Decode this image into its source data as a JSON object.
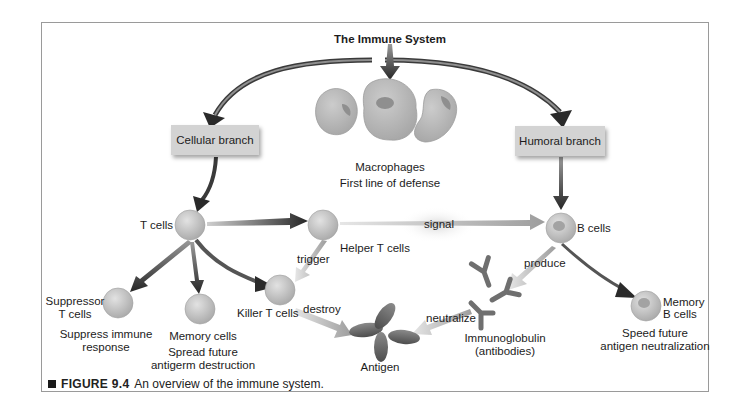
{
  "diagram": {
    "title": "The Immune System",
    "branches": {
      "cellular": "Cellular branch",
      "humoral": "Humoral branch"
    },
    "macrophages": {
      "name": "Macrophages",
      "role": "First line of defense"
    },
    "cells": {
      "t_cells": "T cells",
      "helper_t": "Helper T cells",
      "b_cells": "B cells",
      "suppressor_t_line1": "Suppressor",
      "suppressor_t_line2": "T cells",
      "suppressor_role_line1": "Suppress immune",
      "suppressor_role_line2": "response",
      "memory_cells": "Memory cells",
      "memory_role_line1": "Spread future",
      "memory_role_line2": "antigerm destruction",
      "killer_t": "Killer T cells",
      "memory_b_line1": "Memory",
      "memory_b_line2": "B cells",
      "memory_b_role_line1": "Speed future",
      "memory_b_role_line2": "antigen neutralization",
      "antigen": "Antigen",
      "immunoglobulin_line1": "Immunoglobulin",
      "immunoglobulin_line2": "(antibodies)"
    },
    "edges": {
      "signal": "signal",
      "trigger": "trigger",
      "destroy": "destroy",
      "produce": "produce",
      "neutralize": "neutralize"
    },
    "colors": {
      "box_fill": "#d3d3d3",
      "cell_fill": "#c9c9c9",
      "macrophage_fill": "#bdbdbd",
      "arrow_dark": "#2a2a2a",
      "arrow_light": "#b5b5b5",
      "frame_border": "#9a9a9a"
    }
  },
  "caption": {
    "figure_label": "FIGURE 9.4",
    "text": "An overview of the immune system."
  }
}
